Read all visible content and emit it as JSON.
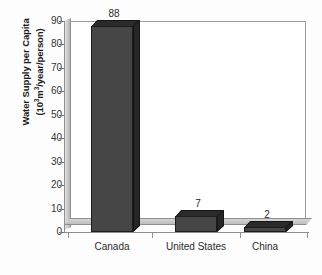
{
  "chart_data": {
    "type": "bar",
    "title": "",
    "subtitle": "",
    "categories": [
      "Canada",
      "United States",
      "China"
    ],
    "values": [
      88,
      7,
      2
    ],
    "value_labels": [
      "88",
      "7",
      "2"
    ],
    "xlabel": "",
    "ylabel": "Water Supply per Capita (10^3 m^3/year/person)",
    "ylabel_line1": "Water Supply per Capita",
    "ylabel_line2_prefix": "(10",
    "ylabel_line2_exp1": "3",
    "ylabel_line2_mid": "m",
    "ylabel_line2_exp2": "3",
    "ylabel_line2_suffix": "/year/person)",
    "ylim": [
      0,
      90
    ],
    "ytick_values": [
      0,
      10,
      20,
      30,
      40,
      50,
      60,
      70,
      80,
      90
    ],
    "ytick_labels": [
      "0",
      "10",
      "20",
      "30",
      "40",
      "50",
      "60",
      "70",
      "80",
      "90"
    ],
    "grid": false,
    "legend": false,
    "legend_position": "none",
    "style": "3d-bar",
    "colors": {
      "bar_face": "#464646",
      "bar_top": "#2b2b2b",
      "bar_side": "#262626",
      "bar_outline": "#1c1c1c",
      "axis_line": "#8f8f8f",
      "wall": "#c9c9c9",
      "floor": "#bdbdbd",
      "plot_background": "#ffffff",
      "page_background": "#fdfdfd",
      "text": "#2a2a2a"
    }
  }
}
